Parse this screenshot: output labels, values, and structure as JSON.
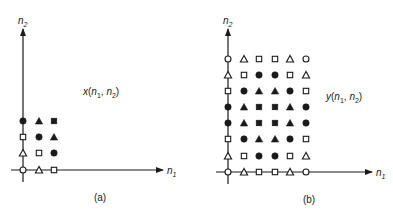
{
  "colors": {
    "ink": "#1a1a1a",
    "background": "#ffffff"
  },
  "panels": [
    {
      "id": "a",
      "caption": "(a)",
      "signal_label": {
        "name": "x",
        "open": "(",
        "n1": "n",
        "n1_sub": "1",
        "sep": ", ",
        "n2": "n",
        "n2_sub": "2",
        "close": ")"
      },
      "x_axis_label": {
        "base": "n",
        "sub": "1"
      },
      "y_axis_label": {
        "base": "n",
        "sub": "2"
      },
      "grid_size": {
        "n1": 3,
        "n2": 4
      },
      "rows_top_to_bottom": [
        [
          "filled-circle",
          "filled-triangle",
          "filled-square"
        ],
        [
          "open-square",
          "filled-circle",
          "filled-triangle"
        ],
        [
          "open-triangle",
          "open-square",
          "filled-circle"
        ],
        [
          "open-circle",
          "open-triangle",
          "open-square"
        ]
      ]
    },
    {
      "id": "b",
      "caption": "(b)",
      "signal_label": {
        "name": "y",
        "open": "(",
        "n1": "n",
        "n1_sub": "1",
        "sep": ", ",
        "n2": "n",
        "n2_sub": "2",
        "close": ")"
      },
      "x_axis_label": {
        "base": "n",
        "sub": "1"
      },
      "y_axis_label": {
        "base": "n",
        "sub": "2"
      },
      "grid_size": {
        "n1": 6,
        "n2": 8
      },
      "rows_top_to_bottom": [
        [
          "open-circle",
          "open-triangle",
          "open-square",
          "open-square",
          "open-triangle",
          "open-circle"
        ],
        [
          "open-triangle",
          "open-square",
          "filled-circle",
          "filled-circle",
          "open-square",
          "open-triangle"
        ],
        [
          "open-square",
          "filled-circle",
          "filled-triangle",
          "filled-triangle",
          "filled-circle",
          "open-square"
        ],
        [
          "filled-circle",
          "filled-triangle",
          "filled-square",
          "filled-square",
          "filled-triangle",
          "filled-circle"
        ],
        [
          "filled-circle",
          "filled-triangle",
          "filled-square",
          "filled-square",
          "filled-triangle",
          "filled-circle"
        ],
        [
          "open-square",
          "filled-circle",
          "filled-triangle",
          "filled-triangle",
          "filled-circle",
          "open-square"
        ],
        [
          "open-triangle",
          "open-square",
          "filled-circle",
          "filled-circle",
          "open-square",
          "open-triangle"
        ],
        [
          "open-circle",
          "open-triangle",
          "open-square",
          "open-square",
          "open-triangle",
          "open-circle"
        ]
      ]
    }
  ]
}
